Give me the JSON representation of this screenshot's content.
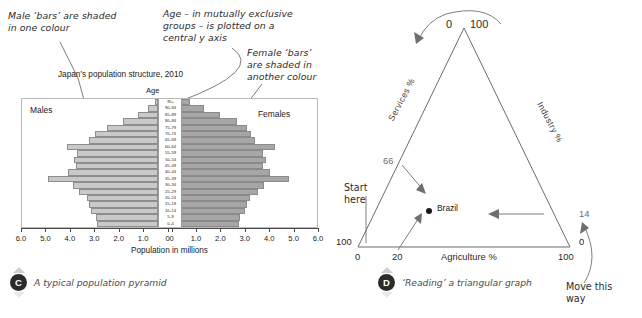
{
  "annotations": {
    "male_note": "Male ‘bars’ are shaded\nin one colour",
    "age_note": "Age – in mutually exclusive\ngroups – is plotted on a\ncentral y axis",
    "female_note": "Female ‘bars’\nare shaded in\nanother colour"
  },
  "pyramid": {
    "title": "Japan’s population structure, 2010",
    "y_axis_label": "Age",
    "x_axis_label": "Population in millions",
    "left_series_label": "Males",
    "right_series_label": "Females",
    "x_ticks_left": [
      "6.0",
      "5.0",
      "4.0",
      "3.0",
      "2.0",
      "1.0",
      "0"
    ],
    "x_ticks_right": [
      "0",
      "1.0",
      "2.0",
      "3.0",
      "4.0",
      "5.0",
      "6.0"
    ],
    "age_groups": [
      "95+",
      "90–94",
      "85–89",
      "80–84",
      "75–79",
      "70–74",
      "65–69",
      "60–64",
      "55–59",
      "50–54",
      "45–49",
      "40–44",
      "35–39",
      "30–34",
      "25–29",
      "20–24",
      "15–19",
      "10–14",
      "5–9",
      "0–4"
    ]
  },
  "chart_data": [
    {
      "type": "bar",
      "title": "Japan’s population structure, 2010",
      "xlabel": "Population in millions",
      "ylabel": "Age",
      "xlim": [
        0,
        6
      ],
      "grid": false,
      "legend": [
        "Males",
        "Females"
      ],
      "legend_position": "inside-top-corners",
      "categories": [
        "95+",
        "90–94",
        "85–89",
        "80–84",
        "75–79",
        "70–74",
        "65–69",
        "60–64",
        "55–59",
        "50–54",
        "45–49",
        "40–44",
        "35–39",
        "30–34",
        "25–29",
        "20–24",
        "15–19",
        "10–14",
        "5–9",
        "0–4"
      ],
      "series": [
        {
          "name": "Males",
          "values": [
            0.12,
            0.42,
            0.88,
            1.55,
            2.25,
            2.75,
            3.05,
            4.0,
            3.55,
            3.72,
            3.6,
            3.95,
            4.85,
            3.75,
            3.48,
            3.12,
            3.05,
            2.95,
            2.72,
            2.68
          ]
        },
        {
          "name": "Females",
          "values": [
            0.4,
            1.02,
            1.72,
            2.45,
            2.9,
            3.1,
            3.25,
            4.15,
            3.62,
            3.75,
            3.6,
            3.9,
            4.75,
            3.65,
            3.38,
            3.02,
            2.92,
            2.82,
            2.6,
            2.55
          ]
        }
      ],
      "colors": {
        "Males": "#c9c9c9",
        "Females": "#a6a6a6"
      }
    },
    {
      "type": "scatter",
      "title": "‘Reading’ a triangular graph",
      "axes": [
        "Agriculture %",
        "Industry %",
        "Services %"
      ],
      "apex_labels": {
        "top_left": "0",
        "top_right": "100"
      },
      "bottom_left_labels": {
        "services": "100",
        "agriculture": "0"
      },
      "bottom_right_labels": {
        "industry": "0",
        "agriculture": "100"
      },
      "bottom_tick": "20",
      "left_axis_value": "66",
      "right_axis_value": "14",
      "points": [
        {
          "name": "Brazil",
          "agriculture": 20,
          "industry": 14,
          "services": 66
        }
      ]
    }
  ],
  "triangle": {
    "axis_agriculture": "Agriculture %",
    "axis_industry": "Industry %",
    "axis_services": "Services %",
    "apex_left": "0",
    "apex_right": "100",
    "left_corner_value": "100",
    "left_corner_zero": "0",
    "right_corner_value": "100",
    "right_corner_zero": "0",
    "tick_20": "20",
    "value_66": "66",
    "value_14": "14",
    "point_label": "Brazil",
    "hint_start": "Start\nhere",
    "hint_move": "Move this\nway"
  },
  "captions": {
    "c_letter": "C",
    "c_text": "A typical population pyramid",
    "d_letter": "D",
    "d_text": "‘Reading’ a triangular graph"
  }
}
